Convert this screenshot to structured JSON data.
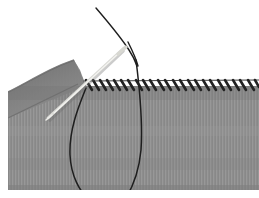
{
  "figure": {
    "canvas": {
      "width": 259,
      "height": 198
    },
    "background_color": "#ffffff"
  },
  "fabric": {
    "name": "gray woven fabric panel",
    "base_color": "#8d8d8d",
    "shadow_color": "#6f6f6f",
    "highlight_color": "#9a9a9a",
    "weave_texture": "fine vertical stripes",
    "top_edge_y": 86,
    "bottom_edge_y": 190,
    "left_edge_x": 8,
    "right_edge_x": 259,
    "fold": {
      "name": "folded corner flap at upper left",
      "description": "fabric edge curves up and to the left forming a shaded triangular fold",
      "apex_x": 74,
      "apex_y": 86
    }
  },
  "stitching": {
    "name": "whipstitch row",
    "type": "whipstitch",
    "thread_color": "#242424",
    "stitch_count": 24,
    "slant_direction": "top-left to bottom-right",
    "start_x": 82,
    "end_x": 256,
    "baseline_y": 87,
    "stitch_length": 9,
    "stitch_spacing": 7.3
  },
  "needle": {
    "name": "sewing needle",
    "color": "#e8e8e4",
    "shadow_color": "#b6b6b0",
    "tip_x": 48,
    "tip_y": 118,
    "eye_x": 124,
    "eye_y": 49,
    "description": "light metallic needle passing through the fabric at the seam line, eye end raised to the upper right"
  },
  "thread": {
    "name": "working thread",
    "color": "#1e1e1e",
    "width": 1.4,
    "description": "thread runs from the upper area down through the needle eye, through the seam, and hangs in a long loop below the fabric",
    "free_end_top": {
      "x": 96,
      "y": 8
    },
    "loop_bottom_y": 198,
    "loop_left_x": 69,
    "loop_right_x": 140
  }
}
